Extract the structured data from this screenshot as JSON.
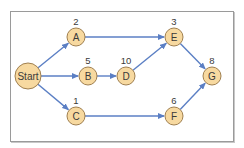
{
  "diagram": {
    "type": "network-activity-diagram",
    "colors": {
      "node_fill": "#f7d9a0",
      "node_stroke": "#a08050",
      "edge": "#5b7fc4",
      "frame": "#9a9a9a",
      "text": "#3a3a3a"
    },
    "nodes": [
      {
        "id": "Start",
        "label": "Start",
        "duration": "",
        "x": 28,
        "y": 76,
        "r": 13
      },
      {
        "id": "A",
        "label": "A",
        "duration": "2",
        "x": 76,
        "y": 37,
        "r": 9
      },
      {
        "id": "B",
        "label": "B",
        "duration": "5",
        "x": 88,
        "y": 76,
        "r": 9
      },
      {
        "id": "C",
        "label": "C",
        "duration": "1",
        "x": 76,
        "y": 116,
        "r": 9
      },
      {
        "id": "D",
        "label": "D",
        "duration": "10",
        "x": 126,
        "y": 76,
        "r": 9
      },
      {
        "id": "E",
        "label": "E",
        "duration": "3",
        "x": 174,
        "y": 37,
        "r": 9
      },
      {
        "id": "F",
        "label": "F",
        "duration": "6",
        "x": 174,
        "y": 116,
        "r": 9
      },
      {
        "id": "G",
        "label": "G",
        "duration": "8",
        "x": 212,
        "y": 76,
        "r": 9
      }
    ],
    "edges": [
      {
        "from": "Start",
        "to": "A"
      },
      {
        "from": "Start",
        "to": "B"
      },
      {
        "from": "Start",
        "to": "C"
      },
      {
        "from": "A",
        "to": "E"
      },
      {
        "from": "B",
        "to": "D"
      },
      {
        "from": "D",
        "to": "E"
      },
      {
        "from": "C",
        "to": "F"
      },
      {
        "from": "E",
        "to": "G"
      },
      {
        "from": "F",
        "to": "G"
      }
    ]
  }
}
